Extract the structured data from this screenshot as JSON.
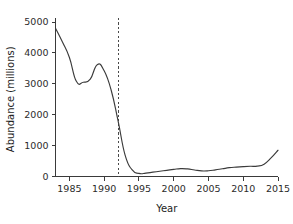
{
  "chart_data": {
    "type": "line",
    "title": "",
    "xlabel": "Year",
    "ylabel": "Abundance (millions)",
    "xlim": [
      1983,
      2015
    ],
    "ylim": [
      0,
      5000
    ],
    "grid": false,
    "legend": "none",
    "x_ticks": [
      1985,
      1990,
      1995,
      2000,
      2005,
      2010,
      2015
    ],
    "x_tick_labels": [
      "1985",
      "1990",
      "1995",
      "2000",
      "2005",
      "2010",
      "2015"
    ],
    "y_ticks": [
      0,
      1000,
      2000,
      3000,
      4000,
      5000
    ],
    "y_tick_labels": [
      "0",
      "1000",
      "2000",
      "3000",
      "4000",
      "5000"
    ],
    "series": [
      {
        "name": "Abundance",
        "color": "#3b3b3b",
        "x": [
          1983,
          1984,
          1985,
          1986,
          1987,
          1988,
          1989,
          1990,
          1991,
          1992,
          1993,
          1994,
          1995,
          1996,
          1997,
          1998,
          1999,
          2000,
          2001,
          2002,
          2003,
          2004,
          2005,
          2006,
          2007,
          2008,
          2009,
          2010,
          2011,
          2012,
          2013,
          2014,
          2015
        ],
        "values": [
          4800,
          4350,
          3850,
          3080,
          3050,
          3150,
          3620,
          3420,
          2800,
          1800,
          700,
          220,
          100,
          110,
          140,
          170,
          200,
          230,
          255,
          245,
          210,
          180,
          185,
          215,
          250,
          285,
          305,
          320,
          330,
          335,
          400,
          600,
          850
        ]
      }
    ],
    "annotations": [
      {
        "name": "moratorium-line",
        "type": "vertical-dashed-line",
        "x": 1992,
        "color": "#4a4a4a"
      }
    ]
  },
  "axes": {
    "x_axis_name": "Year",
    "y_axis_name": "Abundance (millions)"
  }
}
